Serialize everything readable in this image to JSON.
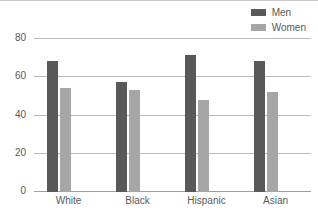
{
  "chart_data": {
    "type": "bar",
    "title": "",
    "xlabel": "",
    "ylabel": "",
    "categories": [
      "White",
      "Black",
      "Hispanic",
      "Asian"
    ],
    "series": [
      {
        "name": "Men",
        "color": "#595959",
        "values": [
          68,
          57,
          71,
          68
        ]
      },
      {
        "name": "Women",
        "color": "#a6a6a6",
        "values": [
          54,
          53,
          48,
          52
        ]
      }
    ],
    "ylim": [
      0,
      80
    ],
    "yticks": [
      0,
      20,
      40,
      60,
      80
    ],
    "ytick_labels": [
      "0",
      "20",
      "40",
      "60",
      "80"
    ],
    "grid": true,
    "legend_position": "top-right"
  },
  "legend": {
    "items": [
      {
        "label": "Men",
        "swatch_color": "#595959",
        "icon": "legend-swatch-icon"
      },
      {
        "label": "Women",
        "swatch_color": "#a6a6a6",
        "icon": "legend-swatch-icon"
      }
    ]
  },
  "axes": {
    "y_labels": [
      "80",
      "60",
      "40",
      "20",
      "0"
    ],
    "x_labels": [
      "White",
      "Black",
      "Hispanic",
      "Asian"
    ]
  },
  "colors": {
    "men": "#595959",
    "women": "#a6a6a6",
    "gridline": "#b9b9b9",
    "text": "#58595b",
    "background": "#ffffff"
  }
}
